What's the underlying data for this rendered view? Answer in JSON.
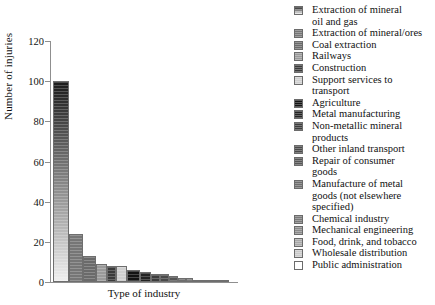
{
  "chart_data": {
    "type": "bar",
    "title": "",
    "xlabel": "Type of industry",
    "ylabel": "Number of injuries",
    "ylim": [
      0,
      120
    ],
    "yticks": [
      0,
      20,
      40,
      60,
      80,
      100,
      120
    ],
    "grid": false,
    "legend_position": "right",
    "categories": [
      "Extraction of mineral oil and gas",
      "Extraction of mineral/ores",
      "Coal extraction",
      "Railways",
      "Construction",
      "Support services to transport",
      "Agriculture",
      "Metal manufacturing",
      "Non-metallic mineral products",
      "Other inland transport",
      "Repair of consumer goods",
      "Manufacture of metal goods (not elsewhere specified)",
      "Chemical industry",
      "Mechanical engineering",
      "Food, drink, and tobacco",
      "Wholesale distribution",
      "Public administration"
    ],
    "values": [
      100,
      24,
      13,
      9,
      8,
      8,
      6,
      5,
      4,
      4,
      3,
      2,
      2,
      1,
      1,
      1,
      1
    ],
    "bar_colors": [
      "#5a5a5a",
      "#767676",
      "#6a6a6a",
      "#9a9a9a",
      "#3a3a3a",
      "#cfcfcf",
      "#131313",
      "#232323",
      "#3d3d3d",
      "#4a4a4a",
      "#555555",
      "#6d6d6d",
      "#7a7a7a",
      "#8b8b8b",
      "#a8a8a8",
      "#c9c9c9",
      "#f2f2f2"
    ],
    "bar_gradient_first": {
      "top": "#1b1b1b",
      "bottom": "#efefef"
    }
  },
  "legend": {
    "items": [
      {
        "label": "Extraction of mineral\noil and gas",
        "color": "#5a5a5a"
      },
      {
        "label": "Extraction of mineral/ores",
        "color": "#767676"
      },
      {
        "label": "Coal extraction",
        "color": "#6a6a6a"
      },
      {
        "label": "Railways",
        "color": "#9a9a9a"
      },
      {
        "label": "Construction",
        "color": "#3a3a3a"
      },
      {
        "label": "Support services to\ntransport",
        "color": "#cfcfcf"
      },
      {
        "label": "Agriculture",
        "color": "#131313"
      },
      {
        "label": "Metal manufacturing",
        "color": "#232323"
      },
      {
        "label": "Non-metallic mineral\nproducts",
        "color": "#3d3d3d"
      },
      {
        "label": "Other inland transport",
        "color": "#4a4a4a"
      },
      {
        "label": "Repair of consumer\ngoods",
        "color": "#555555"
      },
      {
        "label": "Manufacture of metal\ngoods (not elsewhere\nspecified)",
        "color": "#6d6d6d"
      },
      {
        "label": "Chemical industry",
        "color": "#7a7a7a"
      },
      {
        "label": "Mechanical engineering",
        "color": "#8b8b8b"
      },
      {
        "label": "Food, drink, and tobacco",
        "color": "#a8a8a8"
      },
      {
        "label": "Wholesale distribution",
        "color": "#c9c9c9"
      },
      {
        "label": "Public administration",
        "color": "#ffffff"
      }
    ]
  }
}
